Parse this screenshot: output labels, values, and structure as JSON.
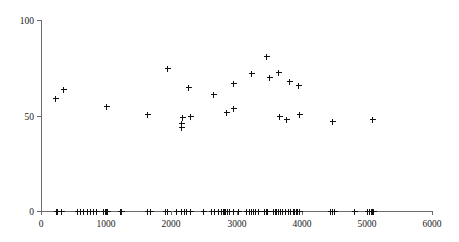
{
  "chart_data": {
    "type": "scatter",
    "title": "",
    "subtitle": "",
    "xlabel": "",
    "ylabel": "",
    "xlim": [
      0,
      6000
    ],
    "ylim": [
      0,
      100
    ],
    "xticks": [
      0,
      1000,
      2000,
      3000,
      4000,
      5000,
      6000
    ],
    "yticks": [
      0,
      50,
      100
    ],
    "xticklabels": [
      "0",
      "1000",
      "2000",
      "3000",
      "4000",
      "5000",
      "6000"
    ],
    "yticklabels": [
      "0",
      "50",
      "100"
    ],
    "grid": false,
    "legend": null,
    "marker": "plus",
    "marker_color": "#111111",
    "axis_color": "#6b6b6b",
    "series": [
      {
        "name": "upper-cluster",
        "points": [
          [
            210,
            59
          ],
          [
            340,
            64
          ],
          [
            990,
            55
          ],
          [
            1630,
            51
          ],
          [
            1930,
            75
          ],
          [
            2150,
            46
          ],
          [
            2155,
            44
          ],
          [
            2160,
            49
          ],
          [
            2250,
            65
          ],
          [
            2290,
            50
          ],
          [
            2640,
            61
          ],
          [
            2840,
            52
          ],
          [
            2940,
            54
          ],
          [
            2950,
            67
          ],
          [
            3230,
            72
          ],
          [
            3450,
            81
          ],
          [
            3500,
            70
          ],
          [
            3630,
            73
          ],
          [
            3650,
            50
          ],
          [
            3760,
            48
          ],
          [
            3810,
            68
          ],
          [
            3950,
            66
          ],
          [
            3960,
            51
          ],
          [
            4460,
            47
          ],
          [
            5080,
            48
          ]
        ]
      },
      {
        "name": "baseline-rug",
        "points": [
          [
            225,
            0
          ],
          [
            245,
            0
          ],
          [
            310,
            0
          ],
          [
            560,
            0
          ],
          [
            605,
            0
          ],
          [
            640,
            0
          ],
          [
            700,
            0
          ],
          [
            745,
            0
          ],
          [
            800,
            0
          ],
          [
            840,
            0
          ],
          [
            955,
            0
          ],
          [
            975,
            0
          ],
          [
            990,
            0
          ],
          [
            1000,
            0
          ],
          [
            1010,
            0
          ],
          [
            1020,
            0
          ],
          [
            1210,
            0
          ],
          [
            1225,
            0
          ],
          [
            1620,
            0
          ],
          [
            1675,
            0
          ],
          [
            1905,
            0
          ],
          [
            1935,
            0
          ],
          [
            2075,
            0
          ],
          [
            2150,
            0
          ],
          [
            2200,
            0
          ],
          [
            2230,
            0
          ],
          [
            2280,
            0
          ],
          [
            2480,
            0
          ],
          [
            2610,
            0
          ],
          [
            2650,
            0
          ],
          [
            2720,
            0
          ],
          [
            2760,
            0
          ],
          [
            2790,
            0
          ],
          [
            2810,
            0
          ],
          [
            2830,
            0
          ],
          [
            2855,
            0
          ],
          [
            2880,
            0
          ],
          [
            2950,
            0
          ],
          [
            3030,
            0
          ],
          [
            3140,
            0
          ],
          [
            3185,
            0
          ],
          [
            3230,
            0
          ],
          [
            3260,
            0
          ],
          [
            3290,
            0
          ],
          [
            3330,
            0
          ],
          [
            3420,
            0
          ],
          [
            3450,
            0
          ],
          [
            3470,
            0
          ],
          [
            3560,
            0
          ],
          [
            3590,
            0
          ],
          [
            3610,
            0
          ],
          [
            3640,
            0
          ],
          [
            3670,
            0
          ],
          [
            3700,
            0
          ],
          [
            3740,
            0
          ],
          [
            3790,
            0
          ],
          [
            3820,
            0
          ],
          [
            3860,
            0
          ],
          [
            3890,
            0
          ],
          [
            3910,
            0
          ],
          [
            3930,
            0
          ],
          [
            3960,
            0
          ],
          [
            4430,
            0
          ],
          [
            4460,
            0
          ],
          [
            4490,
            0
          ],
          [
            4800,
            0
          ],
          [
            5010,
            0
          ],
          [
            5040,
            0
          ],
          [
            5060,
            0
          ],
          [
            5080,
            0
          ],
          [
            5095,
            0
          ]
        ]
      }
    ]
  },
  "plot_geometry": {
    "x_px_min": 41,
    "x_px_max": 432,
    "y_px_zero": 211,
    "y_px_top": 20,
    "marker_half": 3.0
  }
}
